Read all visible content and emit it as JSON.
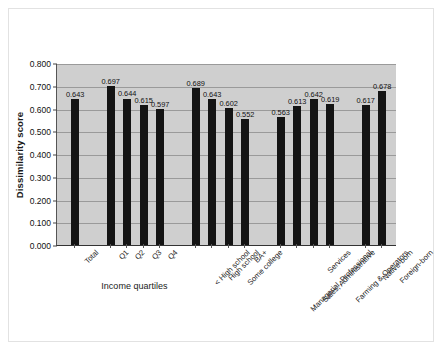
{
  "chart_data": {
    "type": "bar",
    "title": "",
    "xlabel": "",
    "ylabel": "Dissimilarity score",
    "ylim": [
      0,
      0.8
    ],
    "ytick_labels": [
      "0.000",
      "0.100",
      "0.200",
      "0.300",
      "0.400",
      "0.500",
      "0.600",
      "0.700",
      "0.800"
    ],
    "ytick_values": [
      0,
      0.1,
      0.2,
      0.3,
      0.4,
      0.5,
      0.6,
      0.7,
      0.8
    ],
    "grid": true,
    "legend": false,
    "bar_color": "#141414",
    "plot_background": "#cfcfcf",
    "categories": [
      "Total",
      "Q1",
      "Q2",
      "Q3",
      "Q4",
      "< High school",
      "High school",
      "Some college",
      "BA+",
      "Managerial, Professional",
      "Sales, Administrative",
      "Services",
      "Farming & Operators",
      "Native-born",
      "Foreign-born"
    ],
    "values": [
      0.643,
      0.697,
      0.644,
      0.615,
      0.597,
      0.689,
      0.643,
      0.602,
      0.552,
      0.563,
      0.613,
      0.642,
      0.619,
      0.617,
      0.678
    ],
    "data_labels": [
      "0.643",
      "0.697",
      "0.644",
      "0.615",
      "0.597",
      "0.689",
      "0.643",
      "0.602",
      "0.552",
      "0.563",
      "0.613",
      "0.642",
      "0.619",
      "0.617",
      "0.678"
    ],
    "groups": [
      {
        "name": "",
        "label": "",
        "indices": [
          0
        ]
      },
      {
        "name": "income-quartiles",
        "label": "Income quartiles",
        "indices": [
          1,
          2,
          3,
          4
        ]
      },
      {
        "name": "education",
        "label": "",
        "indices": [
          5,
          6,
          7,
          8
        ]
      },
      {
        "name": "occupation",
        "label": "",
        "indices": [
          9,
          10,
          11,
          12
        ]
      },
      {
        "name": "nativity",
        "label": "",
        "indices": [
          13,
          14
        ]
      }
    ]
  }
}
